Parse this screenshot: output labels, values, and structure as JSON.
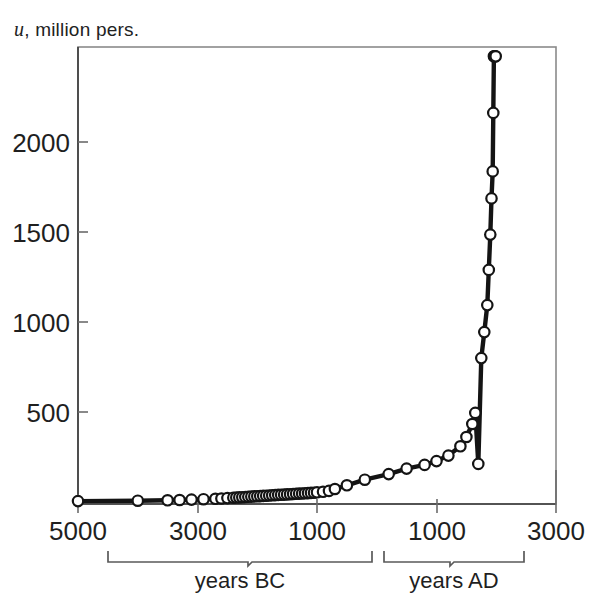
{
  "figure": {
    "ylabel_prefix": "u",
    "ylabel_rest": ", million pers.",
    "ylabel_full": "u, million pers."
  },
  "chart_data": {
    "type": "line",
    "title": "",
    "subtitle": "",
    "xlabel": "",
    "ylabel": "u, million pers.",
    "grid": false,
    "legend": "none",
    "x_tick_labels": [
      "5000",
      "3000",
      "1000",
      "1000",
      "3000"
    ],
    "x_tick_values": [
      -5000,
      -3000,
      -1000,
      1000,
      3000
    ],
    "x_axis_groups": [
      {
        "label": "years BC",
        "from": -5000,
        "to": -1
      },
      {
        "label": "years AD",
        "from": 1,
        "to": 3000
      }
    ],
    "y_tick_labels": [
      "500",
      "1000",
      "1500",
      "2000"
    ],
    "y_tick_values": [
      500,
      1000,
      1500,
      2000
    ],
    "xlim": [
      -5000,
      3000
    ],
    "ylim": [
      0,
      2450
    ],
    "marker": "open-circle",
    "series": [
      {
        "name": "world population",
        "x": [
          -5000,
          -4000,
          -3500,
          -3300,
          -3100,
          -2900,
          -2700,
          -2600,
          -2500,
          -2400,
          -2350,
          -2300,
          -2250,
          -2200,
          -2150,
          -2100,
          -2050,
          -2000,
          -1950,
          -1900,
          -1850,
          -1800,
          -1750,
          -1700,
          -1650,
          -1600,
          -1550,
          -1500,
          -1450,
          -1400,
          -1350,
          -1300,
          -1250,
          -1200,
          -1150,
          -1100,
          -1050,
          -1000,
          -900,
          -800,
          -700,
          -500,
          -200,
          200,
          500,
          800,
          1000,
          1200,
          1400,
          1500,
          1600,
          1650,
          1700,
          1750,
          1800,
          1850,
          1875,
          1900,
          1920,
          1940,
          1950,
          1960,
          1970,
          1980,
          1990
        ],
        "y": [
          5,
          7,
          9,
          11,
          13,
          15,
          17,
          19,
          21,
          23,
          24,
          25,
          26,
          27,
          28,
          29,
          30,
          31,
          32,
          33,
          34,
          35,
          36,
          37,
          38,
          39,
          40,
          41,
          42,
          43,
          44,
          45,
          46,
          47,
          48,
          49,
          50,
          52,
          55,
          60,
          70,
          90,
          120,
          150,
          180,
          200,
          220,
          250,
          300,
          350,
          420,
          480,
          205,
          775,
          915,
          1060,
          1250,
          1440,
          1635,
          1780,
          2095,
          2400,
          2400,
          2400,
          2400
        ]
      }
    ]
  }
}
